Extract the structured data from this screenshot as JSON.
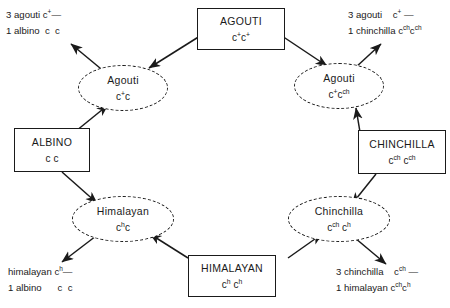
{
  "diagram": {
    "parent_boxes": [
      {
        "name": "agouti-parent",
        "label": "AGOUTI",
        "genotype": "c+c+"
      },
      {
        "name": "albino-parent",
        "label": "ALBINO",
        "genotype": "c c"
      },
      {
        "name": "chinchilla-parent",
        "label": "CHINCHILLA",
        "genotype": "cch cch"
      },
      {
        "name": "himalayan-parent",
        "label": "HIMALAYAN",
        "genotype": "ch ch"
      }
    ],
    "offspring_ellipses": [
      {
        "name": "agouti-albino-f1",
        "label": "Agouti",
        "genotype": "c+c"
      },
      {
        "name": "agouti-chinchilla-f1",
        "label": "Agouti",
        "genotype": "c+cch"
      },
      {
        "name": "himalayan-albino-f1",
        "label": "Himalayan",
        "genotype": "chc"
      },
      {
        "name": "chinchilla-himalayan-f1",
        "label": "Chinchilla",
        "genotype": "cch ch"
      }
    ],
    "ratio_labels": [
      {
        "name": "ratio-top-left",
        "lines": [
          {
            "count": "3",
            "phenotype": "agouti",
            "genotype": "c+—"
          },
          {
            "count": "1",
            "phenotype": "albino",
            "genotype": "c  c"
          }
        ]
      },
      {
        "name": "ratio-top-right",
        "lines": [
          {
            "count": "3",
            "phenotype": "agouti",
            "genotype": "c+ —"
          },
          {
            "count": "1",
            "phenotype": "chinchilla",
            "genotype": "cchcch"
          }
        ]
      },
      {
        "name": "ratio-bottom-left",
        "lines": [
          {
            "count": "",
            "phenotype": "himalayan",
            "genotype": "ch—"
          },
          {
            "count": "1",
            "phenotype": "albino",
            "genotype": "c  c"
          }
        ]
      },
      {
        "name": "ratio-bottom-right",
        "lines": [
          {
            "count": "3",
            "phenotype": "chinchilla",
            "genotype": "cch —"
          },
          {
            "count": "1",
            "phenotype": "himalayan",
            "genotype": "cchch"
          }
        ]
      }
    ],
    "colors": {
      "ink": "#1a1a1a",
      "background": "#ffffff"
    }
  }
}
